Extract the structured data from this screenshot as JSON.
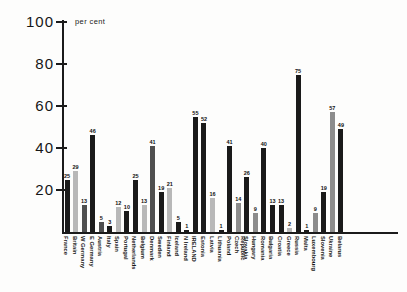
{
  "chart_data": {
    "type": "bar",
    "title": "",
    "ylabel": "per cent",
    "xlabel": "",
    "ylim": [
      0,
      100
    ],
    "yticks": [
      100,
      80,
      60,
      40,
      20
    ],
    "grid": false,
    "legend": "none",
    "categories": [
      "France",
      "Britain",
      "W Germany",
      "E Germany",
      "Austria",
      "Italy",
      "Spain",
      "Portugal",
      "Netherlands",
      "Belgium",
      "Denmark",
      "Sweden",
      "Finland",
      "Iceland",
      "N Ireland",
      "IRELAND",
      "Estonia",
      "Latvia",
      "Lithuania",
      "Poland",
      "Czech Republic",
      "Slovakia",
      "Hungary",
      "Romania",
      "Bulgaria",
      "Croatia",
      "Greece",
      "Russia",
      "Malta",
      "Luxembourg",
      "Slovenia",
      "Ukraine",
      "Belarus"
    ],
    "values": [
      25,
      29,
      13,
      46,
      5,
      3,
      12,
      10,
      25,
      13,
      41,
      19,
      21,
      5,
      1,
      55,
      52,
      16,
      1,
      41,
      14,
      26,
      9,
      40,
      13,
      13,
      2,
      75,
      1,
      9,
      19,
      57,
      49
    ],
    "bar_colors": [
      "#1a1a1a",
      "#b8b8b8",
      "#4f4f4f",
      "#1a1a1a",
      "#4f4f4f",
      "#1a1a1a",
      "#b8b8b8",
      "#1a1a1a",
      "#1a1a1a",
      "#b8b8b8",
      "#4f4f4f",
      "#1a1a1a",
      "#b8b8b8",
      "#1a1a1a",
      "#1a1a1a",
      "#1a1a1a",
      "#1a1a1a",
      "#b8b8b8",
      "#1a1a1a",
      "#1a1a1a",
      "#8c8c8c",
      "#1a1a1a",
      "#8c8c8c",
      "#1a1a1a",
      "#1a1a1a",
      "#1a1a1a",
      "#b8b8b8",
      "#1a1a1a",
      "#1a1a1a",
      "#8c8c8c",
      "#1a1a1a",
      "#8c8c8c",
      "#1a1a1a"
    ]
  },
  "colors": {
    "axis": "#1b1b1b",
    "background": "#fdfdfc",
    "text": "#161616"
  }
}
